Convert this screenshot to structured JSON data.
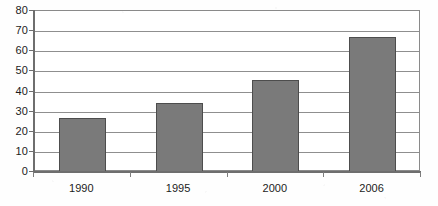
{
  "chart_data": {
    "type": "bar",
    "title": "",
    "subtitle": "",
    "xlabel": "",
    "ylabel": "",
    "categories": [
      "1990",
      "1995",
      "2000",
      "2006"
    ],
    "values": [
      27,
      34.5,
      45.5,
      67
    ],
    "series": [
      {
        "name": "",
        "values": [
          27,
          34.5,
          45.5,
          67
        ]
      }
    ],
    "ylim": [
      0,
      80
    ],
    "ytick_labels": [
      "0",
      "10",
      "20",
      "30",
      "40",
      "50",
      "60",
      "70",
      "80"
    ],
    "ytick_values": [
      0,
      10,
      20,
      30,
      40,
      50,
      60,
      70,
      80
    ],
    "grid": true,
    "grid_axis": "y",
    "legend": false,
    "legend_position": "none",
    "bar_fill_color": "#7a7a7a",
    "bar_border_color": "#4d4d4d",
    "axis_color": "#6e6e6e",
    "gridline_color": "#8f8f8f",
    "plot_background": "#ffffff",
    "figure_background": "#fefefe"
  }
}
